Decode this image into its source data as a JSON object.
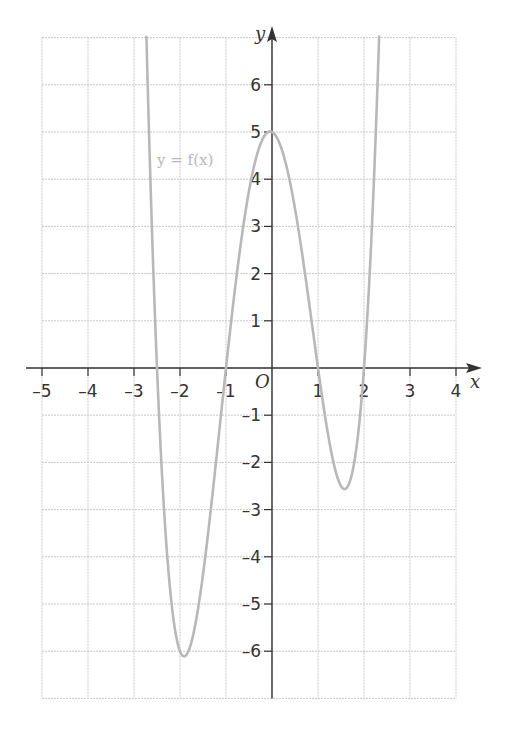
{
  "chart_data": {
    "type": "line",
    "title": "",
    "xlabel": "x",
    "ylabel": "y",
    "origin_label": "O",
    "xlim": [
      -5,
      4
    ],
    "ylim": [
      -7,
      7
    ],
    "grid": true,
    "x_ticks": [
      -5,
      -4,
      -3,
      -2,
      -1,
      1,
      2,
      3,
      4
    ],
    "x_tick_labels": [
      "–5",
      "–4",
      "–3",
      "–2",
      "–1",
      "1",
      "2",
      "3",
      "4"
    ],
    "y_ticks": [
      -6,
      -5,
      -4,
      -3,
      -2,
      -1,
      1,
      2,
      3,
      4,
      5,
      6
    ],
    "y_tick_labels": [
      "–6",
      "–5",
      "–4",
      "–3",
      "–2",
      "–1",
      "1",
      "2",
      "3",
      "4",
      "5",
      "6"
    ],
    "series": [
      {
        "name": "y = f(x)",
        "formula": "f(x) = (x + 2.5)(x + 1)(x - 1)(x - 2)",
        "color": "#b8b8b8",
        "roots": [
          -2.5,
          -1,
          1,
          2
        ],
        "y_intercept": 5,
        "key_points": [
          {
            "x": -2.5,
            "y": 0
          },
          {
            "x": -1.9,
            "y": -6.1
          },
          {
            "x": -1,
            "y": 0
          },
          {
            "x": 0,
            "y": 5
          },
          {
            "x": 1,
            "y": 0
          },
          {
            "x": 1.57,
            "y": -2.56
          },
          {
            "x": 2,
            "y": 0
          }
        ],
        "x": [
          -2.7,
          -2.6,
          -2.5,
          -2.4,
          -2.3,
          -2.2,
          -2.1,
          -2.0,
          -1.9,
          -1.8,
          -1.7,
          -1.6,
          -1.5,
          -1.4,
          -1.3,
          -1.2,
          -1.1,
          -1.0,
          -0.9,
          -0.8,
          -0.7,
          -0.6,
          -0.5,
          -0.4,
          -0.3,
          -0.2,
          -0.1,
          0.0,
          0.1,
          0.2,
          0.3,
          0.4,
          0.5,
          0.6,
          0.7,
          0.8,
          0.9,
          1.0,
          1.1,
          1.2,
          1.3,
          1.4,
          1.5,
          1.6,
          1.7,
          1.8,
          1.9,
          2.0,
          2.1,
          2.2,
          2.3,
          2.35
        ],
        "y": [
          6.44,
          2.91,
          0.0,
          -2.32,
          -4.1,
          -5.38,
          -6.21,
          -6.0,
          -6.1,
          -5.87,
          -5.47,
          -4.93,
          -4.38,
          -3.76,
          -3.07,
          -2.34,
          -1.6,
          0.0,
          0.79,
          1.51,
          2.19,
          2.81,
          3.38,
          3.88,
          4.3,
          4.63,
          4.87,
          5.0,
          5.02,
          4.93,
          4.72,
          4.39,
          3.94,
          3.39,
          2.74,
          2.02,
          1.24,
          0.0,
          -0.43,
          -1.19,
          -1.84,
          -2.32,
          -2.56,
          -2.52,
          -2.15,
          -1.43,
          -0.32,
          0.0,
          1.15,
          2.66,
          6.18,
          7.7
        ]
      }
    ],
    "legend": {
      "entries": [
        "y = f(x)"
      ],
      "position": "inline, near (-2, 5)"
    }
  },
  "colors": {
    "axis": "#333333",
    "grid": "#c8c8c8",
    "curve": "#b8b8b8",
    "background": "#ffffff"
  }
}
